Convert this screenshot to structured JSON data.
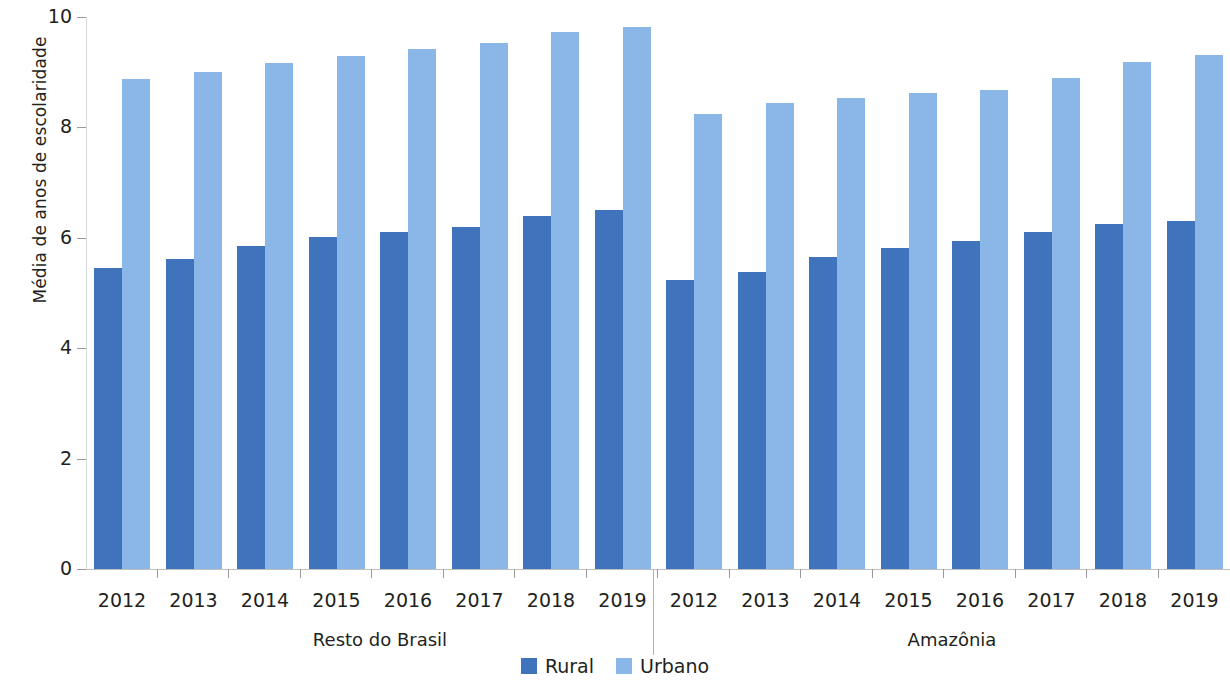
{
  "chart_data": {
    "type": "bar",
    "title": "",
    "subtitle": "",
    "xlabel": "",
    "ylabel": "Média de anos de escolaridade",
    "ylim": [
      0,
      10
    ],
    "yticks": [
      0,
      2,
      4,
      6,
      8,
      10
    ],
    "ytick_labels": [
      "0",
      "2",
      "4",
      "6",
      "8",
      "10"
    ],
    "grid": false,
    "legend_position": "bottom-center",
    "legend": [
      "Rural",
      "Urbano"
    ],
    "series_colors": {
      "Rural": "#3f74bd",
      "Urbano": "#8ab6e8"
    },
    "categories": [
      "2012",
      "2013",
      "2014",
      "2015",
      "2016",
      "2017",
      "2018",
      "2019",
      "2012",
      "2013",
      "2014",
      "2015",
      "2016",
      "2017",
      "2018",
      "2019"
    ],
    "groups": [
      {
        "label": "Resto do Brasil",
        "categories": [
          "2012",
          "2013",
          "2014",
          "2015",
          "2016",
          "2017",
          "2018",
          "2019"
        ],
        "series": [
          {
            "name": "Rural",
            "values": [
              5.45,
              5.62,
              5.85,
              6.02,
              6.1,
              6.2,
              6.4,
              6.5
            ]
          },
          {
            "name": "Urbano",
            "values": [
              8.88,
              9.01,
              9.16,
              9.3,
              9.42,
              9.53,
              9.72,
              9.82
            ]
          }
        ]
      },
      {
        "label": "Amazônia",
        "categories": [
          "2012",
          "2013",
          "2014",
          "2015",
          "2016",
          "2017",
          "2018",
          "2019"
        ],
        "series": [
          {
            "name": "Rural",
            "values": [
              5.23,
              5.38,
              5.65,
              5.82,
              5.95,
              6.1,
              6.25,
              6.3
            ]
          },
          {
            "name": "Urbano",
            "values": [
              8.25,
              8.45,
              8.53,
              8.62,
              8.67,
              8.9,
              9.18,
              9.32
            ]
          }
        ]
      }
    ]
  },
  "axis": {
    "y_title": "Média de anos de escolaridade",
    "y_tick_labels": [
      "10",
      "8",
      "6",
      "4",
      "2",
      "0"
    ]
  },
  "groups": {
    "left_label": "Resto do Brasil",
    "right_label": "Amazônia"
  },
  "legend": {
    "items": [
      {
        "label": "Rural",
        "color": "#3f74bd"
      },
      {
        "label": "Urbano",
        "color": "#8ab6e8"
      }
    ]
  }
}
